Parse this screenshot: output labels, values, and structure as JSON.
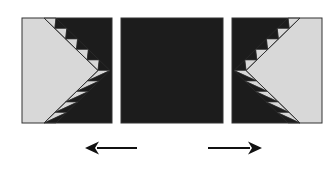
{
  "figure": {
    "colors": {
      "light": "#d8d8d8",
      "dark": "#1c1c1c",
      "outline": "#333333",
      "arrow": "#111111"
    },
    "panels": [
      {
        "id": "left",
        "pattern": "chevron-sawtooth",
        "orientation": "points-right",
        "teeth_per_side": 5
      },
      {
        "id": "middle",
        "pattern": "solid-dark"
      },
      {
        "id": "right",
        "pattern": "chevron-sawtooth",
        "orientation": "points-left",
        "teeth_per_side": 5
      }
    ],
    "arrows": [
      {
        "id": "left-arrow",
        "direction": "left"
      },
      {
        "id": "right-arrow",
        "direction": "right"
      }
    ]
  }
}
